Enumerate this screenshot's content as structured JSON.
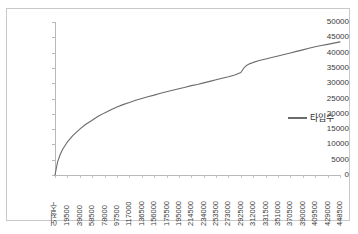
{
  "chart_data": {
    "type": "line",
    "title": "",
    "xlabel": "어절수",
    "ylabel": "",
    "grid": false,
    "legend_position": "right",
    "ylim": [
      0,
      50000
    ],
    "ytick_labels": [
      "50000",
      "45000",
      "40000",
      "35000",
      "30000",
      "25000",
      "20000",
      "15000",
      "10000",
      "5000",
      "0"
    ],
    "ytick_values": [
      50000,
      45000,
      40000,
      35000,
      30000,
      25000,
      20000,
      15000,
      10000,
      5000,
      0
    ],
    "xtick_labels": [
      "어절수",
      "19500",
      "39000",
      "58500",
      "78000",
      "97500",
      "117000",
      "136500",
      "156000",
      "175500",
      "195000",
      "214500",
      "234000",
      "253500",
      "273000",
      "292500",
      "312000",
      "331500",
      "351000",
      "370500",
      "390000",
      "409500",
      "429000",
      "448500"
    ],
    "xtick_values": [
      0,
      19500,
      39000,
      58500,
      78000,
      97500,
      117000,
      136500,
      156000,
      175500,
      195000,
      214500,
      234000,
      253500,
      273000,
      292500,
      312000,
      331500,
      351000,
      370500,
      390000,
      409500,
      429000,
      448500
    ],
    "series": [
      {
        "name": "타입수",
        "color": "#6b6b6b",
        "x": [
          0,
          4000,
          8000,
          12000,
          19500,
          28000,
          39000,
          48000,
          58500,
          68000,
          78000,
          88000,
          97500,
          107000,
          117000,
          127000,
          136500,
          146000,
          156000,
          166000,
          175500,
          185000,
          195000,
          205000,
          214500,
          224000,
          234000,
          243500,
          253500,
          263000,
          273000,
          283000,
          292500,
          297000,
          302000,
          307000,
          312000,
          321500,
          331500,
          341000,
          351000,
          360500,
          370500,
          380000,
          390000,
          399500,
          409500,
          419000,
          429000,
          438500,
          448500
        ],
        "values": [
          0,
          4200,
          6600,
          8400,
          10800,
          12900,
          15000,
          16500,
          17900,
          19200,
          20300,
          21300,
          22200,
          23000,
          23700,
          24400,
          25000,
          25600,
          26100,
          26700,
          27200,
          27700,
          28200,
          28700,
          29200,
          29600,
          30100,
          30600,
          31100,
          31600,
          32100,
          32700,
          33500,
          34900,
          35900,
          36400,
          36800,
          37400,
          37900,
          38400,
          38900,
          39400,
          39900,
          40400,
          40900,
          41400,
          41900,
          42300,
          42700,
          43100,
          43500
        ]
      }
    ]
  }
}
